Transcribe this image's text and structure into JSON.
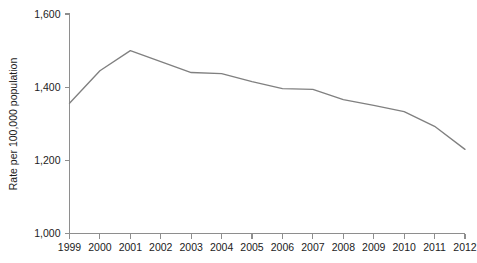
{
  "chart_data": {
    "type": "line",
    "title": "",
    "subtitle": "",
    "xlabel": "",
    "ylabel": "Rate per 100,000 population",
    "x": [
      1999,
      2000,
      2001,
      2002,
      2003,
      2004,
      2005,
      2006,
      2007,
      2008,
      2009,
      2010,
      2011,
      2012
    ],
    "categories": [
      "1999",
      "2000",
      "2001",
      "2002",
      "2003",
      "2004",
      "2005",
      "2006",
      "2007",
      "2008",
      "2009",
      "2010",
      "2011",
      "2012"
    ],
    "values": [
      1356,
      1445,
      1500,
      1470,
      1440,
      1437,
      1415,
      1396,
      1394,
      1366,
      1350,
      1333,
      1293,
      1230
    ],
    "series": [
      {
        "name": "Rate",
        "color": "#808080",
        "values": [
          1356,
          1445,
          1500,
          1470,
          1440,
          1437,
          1415,
          1396,
          1394,
          1366,
          1350,
          1333,
          1293,
          1230
        ]
      }
    ],
    "xlim": [
      1999,
      2012
    ],
    "ylim": [
      1000,
      1600
    ],
    "yticks": [
      1000,
      1200,
      1400,
      1600
    ],
    "ytick_labels": [
      "1,000",
      "1,200",
      "1,400",
      "1,600"
    ],
    "xtick_labels": [
      "1999",
      "2000",
      "2001",
      "2002",
      "2003",
      "2004",
      "2005",
      "2006",
      "2007",
      "2008",
      "2009",
      "2010",
      "2011",
      "2012"
    ],
    "grid": false,
    "legend": false,
    "legend_position": "none",
    "markers": false,
    "annotations": [],
    "colors": {
      "line": "#808080",
      "axis": "#8e8e8e",
      "text": "#1c1c1c",
      "background": "#ffffff"
    }
  }
}
